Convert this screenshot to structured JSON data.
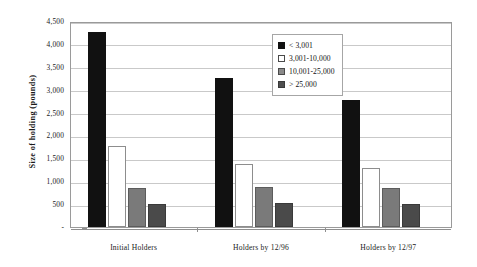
{
  "chart_data": {
    "type": "bar",
    "title": "",
    "subtitle": "",
    "xlabel": "",
    "ylabel": "Size of holding (pounds)",
    "categories": [
      "Initial Holders",
      "Holders by 12/96",
      "Holders by 12/97"
    ],
    "series": [
      {
        "name": "< 3,001",
        "color": "#111111",
        "values": [
          4250,
          3250,
          2775
        ]
      },
      {
        "name": "3,001-10,000",
        "color": "#ffffff",
        "values": [
          1770,
          1380,
          1300
        ]
      },
      {
        "name": "10,001-25,000",
        "color": "#7a7a7a",
        "values": [
          860,
          870,
          860
        ]
      },
      {
        "name": "> 25,000",
        "color": "#4a4a4a",
        "values": [
          500,
          520,
          510
        ]
      }
    ],
    "ylim": [
      0,
      4500
    ],
    "ytick_values": [
      0,
      500,
      1000,
      1500,
      2000,
      2500,
      3000,
      3500,
      4000,
      4500
    ],
    "ytick_labels": [
      "-",
      "500",
      "1,000",
      "1,500",
      "2,000",
      "2,500",
      "3,000",
      "3,500",
      "4,000",
      "4,500"
    ],
    "grid": true,
    "legend_position": "upper-center",
    "legend_entries": [
      "< 3,001",
      "3,001-10,000",
      "10,001-25,000",
      "> 25,000"
    ]
  }
}
